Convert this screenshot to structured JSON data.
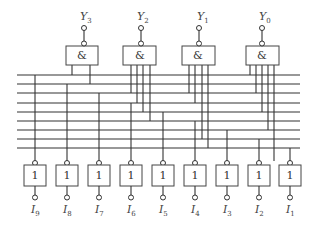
{
  "diagram": {
    "type": "logic-circuit",
    "outputs": [
      {
        "label": "Y",
        "sub": "3",
        "gate_symbol": "&",
        "inputs": 2
      },
      {
        "label": "Y",
        "sub": "2",
        "gate_symbol": "&",
        "inputs": 4
      },
      {
        "label": "Y",
        "sub": "1",
        "gate_symbol": "&",
        "inputs": 4
      },
      {
        "label": "Y",
        "sub": "0",
        "gate_symbol": "&",
        "inputs": 5
      }
    ],
    "inputs": [
      {
        "label": "I",
        "sub": "9",
        "gate_symbol": "1"
      },
      {
        "label": "I",
        "sub": "8",
        "gate_symbol": "1"
      },
      {
        "label": "I",
        "sub": "7",
        "gate_symbol": "1"
      },
      {
        "label": "I",
        "sub": "6",
        "gate_symbol": "1"
      },
      {
        "label": "I",
        "sub": "5",
        "gate_symbol": "1"
      },
      {
        "label": "I",
        "sub": "4",
        "gate_symbol": "1"
      },
      {
        "label": "I",
        "sub": "3",
        "gate_symbol": "1"
      },
      {
        "label": "I",
        "sub": "2",
        "gate_symbol": "1"
      },
      {
        "label": "I",
        "sub": "1",
        "gate_symbol": "1"
      }
    ],
    "bus_lines": 9
  }
}
